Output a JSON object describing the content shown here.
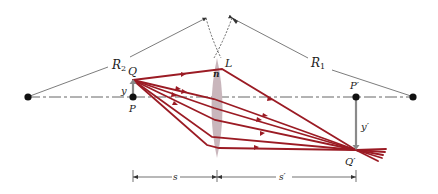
{
  "diagram": {
    "type": "thin lens ray diagram",
    "colors": {
      "ray": "#9b1b24",
      "lens": "#c9b6bc",
      "axis": "#555555",
      "arrow_gray": "#8a8a8a",
      "text": "#222222"
    },
    "labels": {
      "R2_main": "R",
      "R2_sub": "2",
      "R1_main": "R",
      "R1_sub": "1",
      "Q": "Q",
      "P": "P",
      "y": "y",
      "L": "L",
      "n": "n",
      "P_prime": "P′",
      "Q_prime": "Q′",
      "y_prime": "y′",
      "s": "s",
      "s_prime": "s′"
    },
    "points": {
      "center_of_curvature_left": [
        28,
        97
      ],
      "center_of_curvature_right": [
        413,
        97
      ],
      "object_base_P": [
        133,
        97
      ],
      "object_tip_Q": [
        133,
        80
      ],
      "image_base_P_prime": [
        356,
        97
      ],
      "image_tip_Q_prime": [
        356,
        150
      ],
      "lens_center": [
        217,
        108
      ]
    }
  }
}
